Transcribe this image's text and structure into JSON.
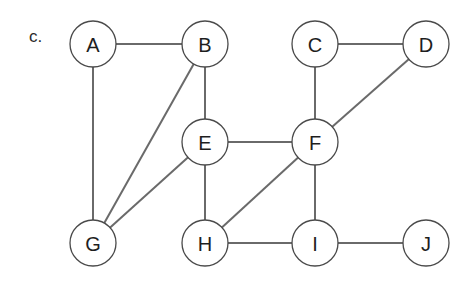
{
  "panel_label": "c.",
  "graph": {
    "node_radius": 23,
    "nodes": [
      {
        "id": "A",
        "label": "A",
        "x": 93,
        "y": 44
      },
      {
        "id": "B",
        "label": "B",
        "x": 205,
        "y": 44
      },
      {
        "id": "C",
        "label": "C",
        "x": 315,
        "y": 44
      },
      {
        "id": "D",
        "label": "D",
        "x": 426,
        "y": 44
      },
      {
        "id": "E",
        "label": "E",
        "x": 205,
        "y": 142
      },
      {
        "id": "F",
        "label": "F",
        "x": 315,
        "y": 142
      },
      {
        "id": "G",
        "label": "G",
        "x": 93,
        "y": 243
      },
      {
        "id": "H",
        "label": "H",
        "x": 205,
        "y": 243
      },
      {
        "id": "I",
        "label": "I",
        "x": 315,
        "y": 243
      },
      {
        "id": "J",
        "label": "J",
        "x": 426,
        "y": 243
      }
    ],
    "edges": [
      [
        "A",
        "B"
      ],
      [
        "A",
        "G"
      ],
      [
        "B",
        "E"
      ],
      [
        "B",
        "G"
      ],
      [
        "C",
        "D"
      ],
      [
        "C",
        "F"
      ],
      [
        "D",
        "F"
      ],
      [
        "E",
        "F"
      ],
      [
        "E",
        "G"
      ],
      [
        "E",
        "H"
      ],
      [
        "F",
        "H"
      ],
      [
        "F",
        "I"
      ],
      [
        "H",
        "I"
      ],
      [
        "I",
        "J"
      ]
    ]
  },
  "colors": {
    "edge": "#6a6a6a",
    "node_stroke": "#4a4a4a",
    "node_fill": "#ffffff",
    "text": "#1e1e1e"
  }
}
